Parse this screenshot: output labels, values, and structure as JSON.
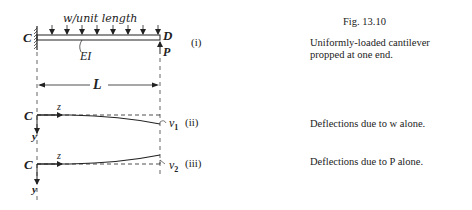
{
  "figure": {
    "number": "Fig. 13.10",
    "caption_lines": [
      "Uniformly-loaded   cantilever",
      "propped at one end."
    ]
  },
  "diagram_i": {
    "load_label": "w/unit length",
    "left_end": "C",
    "right_end": "D",
    "stiffness": "EI",
    "prop_force": "P",
    "tag": "(i)",
    "span_label": "L"
  },
  "diagram_ii": {
    "origin": "C",
    "x_axis": "z",
    "y_axis": "y",
    "deflection": "v",
    "deflection_sub": "1",
    "tag": "(ii)",
    "caption": "Deflections due to w alone."
  },
  "diagram_iii": {
    "origin": "C",
    "x_axis": "z",
    "y_axis": "y",
    "deflection": "v",
    "deflection_sub": "2",
    "tag": "(iii)",
    "caption": "Deflections due to P alone."
  }
}
